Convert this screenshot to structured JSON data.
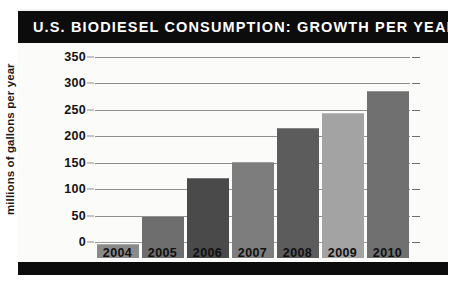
{
  "header": {
    "title": "U.S. BIODIESEL CONSUMPTION: GROWTH PER YEAR",
    "bar_color": "#0c0c0c",
    "text_color": "#ffffff"
  },
  "axis": {
    "ylabel": "millions of gallons per year",
    "yticks": [
      "0",
      "50",
      "100",
      "150",
      "200",
      "250",
      "300",
      "350"
    ],
    "xticks": [
      "2004",
      "2005",
      "2006",
      "2007",
      "2008",
      "2009",
      "2010"
    ]
  },
  "chart_data": {
    "type": "bar",
    "title": "U.S. BIODIESEL CONSUMPTION: GROWTH PER YEAR",
    "categories": [
      "2004",
      "2005",
      "2006",
      "2007",
      "2008",
      "2009",
      "2010"
    ],
    "values": [
      25,
      78,
      149,
      180,
      244,
      272,
      314
    ],
    "xlabel": "",
    "ylabel": "millions of gallons per year",
    "ylim": [
      0,
      350
    ],
    "ytick_step": 50,
    "grid": true,
    "legend": "none",
    "bar_colors": [
      "#8a8a8a",
      "#6e6e6e",
      "#4a4a4a",
      "#7d7d7d",
      "#5c5c5c",
      "#a3a3a3",
      "#707070"
    ]
  },
  "colors": {
    "page_background": "#ffffff",
    "card_background": "#f4f4f2",
    "plot_background": "#fbfbfa",
    "gridline": "#8f8f8f",
    "tick_text": "#121212"
  }
}
